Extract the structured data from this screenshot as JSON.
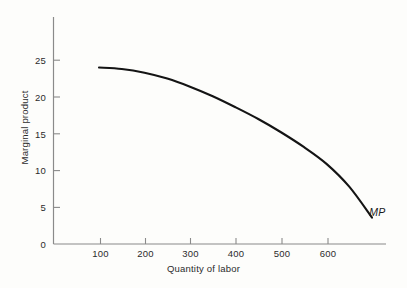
{
  "chart_data": {
    "type": "line",
    "title": "",
    "xlabel": "Quantity of labor",
    "ylabel": "Marginal product",
    "xlim": [
      0,
      700
    ],
    "ylim": [
      0,
      28
    ],
    "xticks": [
      100,
      200,
      300,
      400,
      500,
      600
    ],
    "yticks": [
      0,
      5,
      10,
      15,
      20,
      25
    ],
    "xtick_labels": [
      "100",
      "200",
      "300",
      "400",
      "500",
      "600"
    ],
    "ytick_labels": [
      "0",
      "5",
      "10",
      "15",
      "20",
      "25"
    ],
    "grid": false,
    "legend_position": "inline-end-of-curve",
    "series": [
      {
        "name": "MP",
        "label": "MP",
        "label_style": "italic",
        "color": "#141414",
        "x": [
          100,
          150,
          200,
          250,
          300,
          350,
          400,
          450,
          500,
          550,
          600,
          650,
          700
        ],
        "values": [
          24.0,
          23.8,
          23.3,
          22.5,
          21.4,
          20.1,
          18.6,
          17.0,
          15.2,
          13.2,
          10.9,
          7.8,
          3.6
        ]
      }
    ],
    "annotations": [
      {
        "text": "MP",
        "x": 705,
        "y": 3.0,
        "style": "italic"
      }
    ]
  },
  "axis": {
    "x_title": "Quantity of labor",
    "y_title": "Marginal product"
  }
}
